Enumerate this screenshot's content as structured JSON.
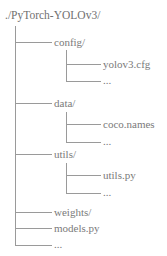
{
  "diagram": {
    "type": "directory-tree",
    "line_color": "#9a9a9a",
    "text_color": "#7a7a7a",
    "root": {
      "label": "./PyTorch-YOLOv3/"
    },
    "children": [
      {
        "label": "config/",
        "children": [
          {
            "label": "yolov3.cfg"
          },
          {
            "label": "..."
          }
        ]
      },
      {
        "label": "data/",
        "children": [
          {
            "label": "coco.names"
          },
          {
            "label": "..."
          }
        ]
      },
      {
        "label": "utils/",
        "children": [
          {
            "label": "utils.py"
          },
          {
            "label": "..."
          }
        ]
      },
      {
        "label": "weights/"
      },
      {
        "label": "models.py"
      },
      {
        "label": "..."
      }
    ]
  }
}
